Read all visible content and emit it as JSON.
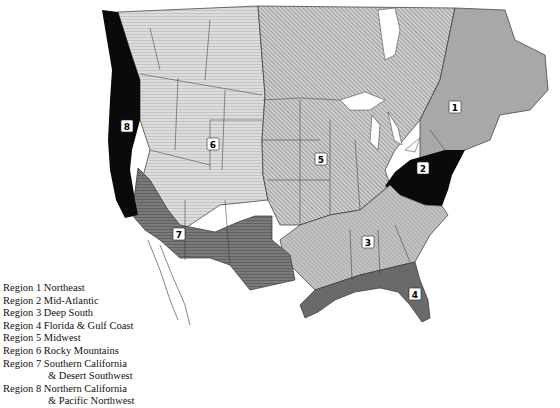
{
  "map": {
    "subject": "North America climate/gardening regions",
    "colors": {
      "region1": "#a9a9a9",
      "region2": "#0a0a0a",
      "region3": "#c4c4c4",
      "region4": "#6b6b6b",
      "region5": "#b0b0b0",
      "region6": "#d9d9d9",
      "region7": "#707070",
      "region8": "#0a0a0a",
      "water": "#ffffff",
      "border": "#222222"
    },
    "badges": [
      {
        "id": "1",
        "label": "1"
      },
      {
        "id": "2",
        "label": "2"
      },
      {
        "id": "3",
        "label": "3"
      },
      {
        "id": "4",
        "label": "4"
      },
      {
        "id": "5",
        "label": "5"
      },
      {
        "id": "6",
        "label": "6"
      },
      {
        "id": "7",
        "label": "7"
      },
      {
        "id": "8",
        "label": "8"
      }
    ]
  },
  "legend": {
    "items": [
      {
        "line1": "Region 1 Northeast"
      },
      {
        "line1": "Region 2 Mid-Atlantic"
      },
      {
        "line1": "Region 3 Deep South"
      },
      {
        "line1": "Region 4 Florida & Gulf Coast"
      },
      {
        "line1": "Region 5 Midwest"
      },
      {
        "line1": "Region 6 Rocky Mountains"
      },
      {
        "line1": "Region 7 Southern California",
        "line2": "& Desert Southwest"
      },
      {
        "line1": "Region 8 Northern California",
        "line2": "& Pacific Northwest"
      }
    ]
  }
}
